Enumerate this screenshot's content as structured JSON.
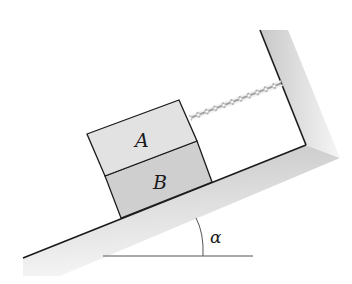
{
  "diagram": {
    "type": "physics-incline",
    "blocks": [
      {
        "label": "A",
        "fill": "#e2e2e2"
      },
      {
        "label": "B",
        "fill": "#cfcfcf"
      }
    ],
    "angle_label": "α",
    "colors": {
      "ground_shade": "#d9d9d9",
      "line": "#1a1a1a",
      "reference_line": "#555555"
    }
  }
}
